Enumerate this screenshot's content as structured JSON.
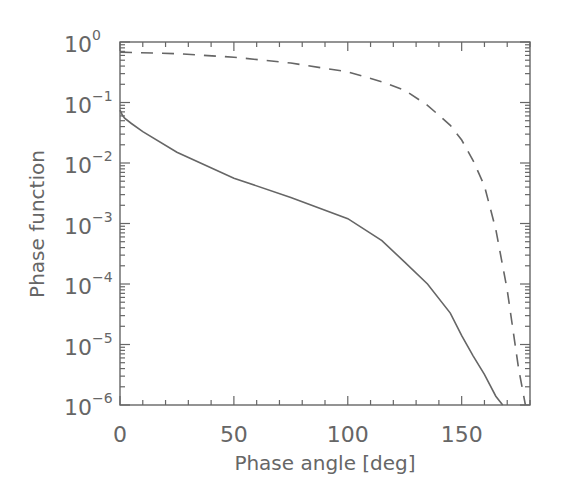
{
  "chart_data": {
    "type": "line",
    "title": "",
    "xlabel": "Phase angle [deg]",
    "ylabel": "Phase function",
    "xlim": [
      0,
      180
    ],
    "ylim": [
      1e-06,
      1
    ],
    "yscale": "log",
    "grid": false,
    "legend": null,
    "x_ticks": [
      0,
      50,
      100,
      150
    ],
    "x_tick_labels": [
      "0",
      "50",
      "100",
      "150"
    ],
    "y_ticks": [
      1,
      0.1,
      0.01,
      0.001,
      0.0001,
      1e-05,
      1e-06
    ],
    "y_tick_labels": [
      {
        "base": "10",
        "exp": "0"
      },
      {
        "base": "10",
        "exp": "−1"
      },
      {
        "base": "10",
        "exp": "−2"
      },
      {
        "base": "10",
        "exp": "−3"
      },
      {
        "base": "10",
        "exp": "−4"
      },
      {
        "base": "10",
        "exp": "−5"
      },
      {
        "base": "10",
        "exp": "−6"
      }
    ],
    "series": [
      {
        "name": "solid",
        "style": "solid",
        "x": [
          0,
          1,
          2,
          5,
          10,
          25,
          50,
          75,
          100,
          115,
          125,
          135,
          145,
          150,
          155,
          160,
          165,
          168
        ],
        "values": [
          0.075,
          0.062,
          0.055,
          0.045,
          0.033,
          0.015,
          0.0056,
          0.0027,
          0.0012,
          0.00052,
          0.00023,
          0.0001,
          3.3e-05,
          1.4e-05,
          6.5e-06,
          3.2e-06,
          1.4e-06,
          1e-06
        ]
      },
      {
        "name": "dashed",
        "style": "dashed",
        "x": [
          0,
          25,
          50,
          75,
          100,
          115,
          125,
          135,
          145,
          150,
          155,
          160,
          165,
          170,
          175,
          178
        ],
        "values": [
          0.68,
          0.64,
          0.56,
          0.45,
          0.32,
          0.22,
          0.16,
          0.09,
          0.042,
          0.024,
          0.011,
          0.0042,
          0.0008,
          8e-05,
          4e-06,
          1e-06
        ]
      }
    ]
  },
  "axes": {
    "xlabel": "Phase angle [deg]",
    "ylabel": "Phase function"
  },
  "colors": {
    "axis": "#666666",
    "line": "#666666",
    "background": "#ffffff"
  }
}
